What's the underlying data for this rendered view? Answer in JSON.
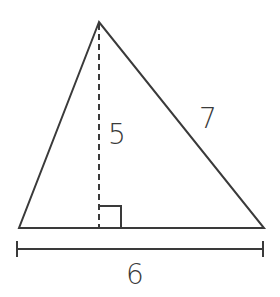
{
  "diagram": {
    "type": "triangle-area",
    "labels": {
      "height": "5",
      "side": "7",
      "base": "6"
    },
    "colors": {
      "stroke": "#3a3a3a",
      "background": "#ffffff"
    }
  }
}
